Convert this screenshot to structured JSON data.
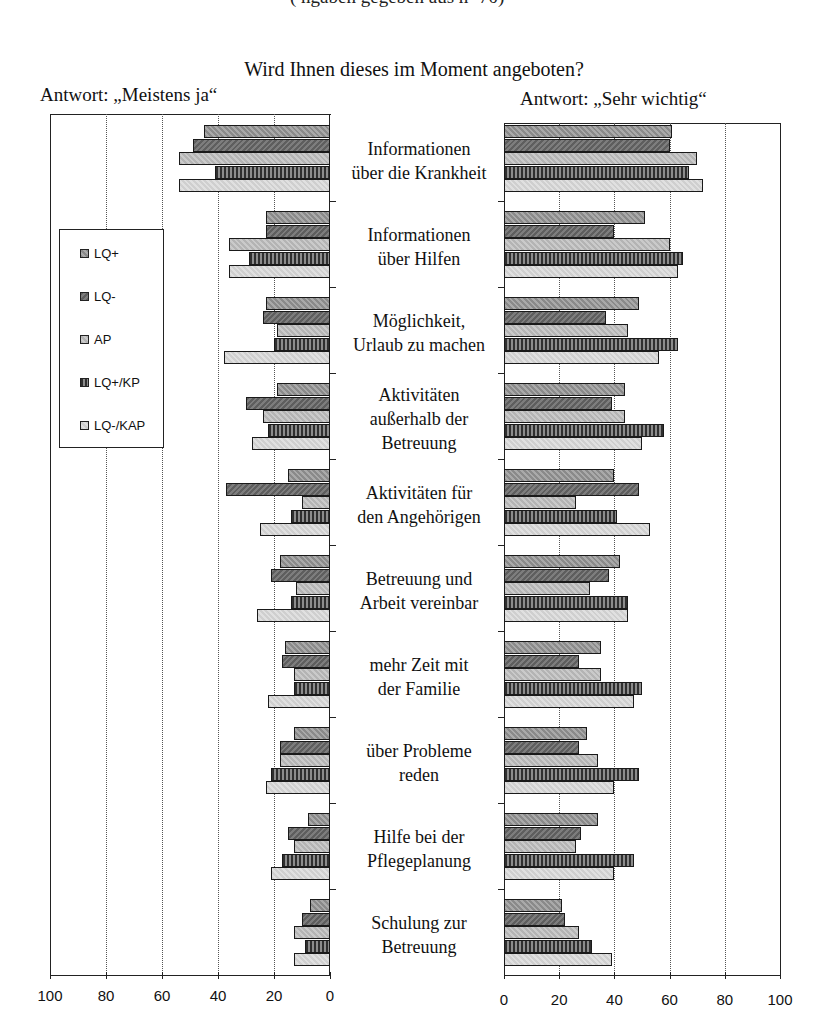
{
  "header": {
    "cutoff_line": "(                   ngaben gegeben aus n=70)",
    "title": "Wird Ihnen dieses im Moment angeboten?",
    "left_subtitle": "Antwort: „Meistens ja“",
    "right_subtitle": "Antwort: „Sehr wichtig“"
  },
  "legend": {
    "items": [
      {
        "label": "LQ+"
      },
      {
        "label": "LQ-"
      },
      {
        "label": "AP"
      },
      {
        "label": "LQ+/KP"
      },
      {
        "label": "LQ-/KAP"
      }
    ]
  },
  "axes": {
    "left_ticks": [
      "100",
      "80",
      "60",
      "40",
      "20",
      "0"
    ],
    "right_ticks": [
      "0",
      "20",
      "40",
      "60",
      "80",
      "100"
    ]
  },
  "categories": [
    {
      "line1": "Informationen",
      "line2": "über die Krankheit",
      "line3": ""
    },
    {
      "line1": "Informationen",
      "line2": "über Hilfen",
      "line3": ""
    },
    {
      "line1": "Möglichkeit,",
      "line2": "Urlaub zu machen",
      "line3": ""
    },
    {
      "line1": "Aktivitäten",
      "line2": "außerhalb der",
      "line3": "Betreuung"
    },
    {
      "line1": "Aktivitäten für",
      "line2": "den Angehörigen",
      "line3": ""
    },
    {
      "line1": "Betreuung und",
      "line2": "Arbeit vereinbar",
      "line3": ""
    },
    {
      "line1": "mehr Zeit mit",
      "line2": "der Familie",
      "line3": ""
    },
    {
      "line1": "über Probleme",
      "line2": "reden",
      "line3": ""
    },
    {
      "line1": "Hilfe bei der",
      "line2": "Pflegeplanung",
      "line3": ""
    },
    {
      "line1": "Schulung zur",
      "line2": "Betreuung",
      "line3": ""
    }
  ],
  "chart_data": [
    {
      "type": "bar",
      "orientation": "horizontal",
      "direction": "right-to-left",
      "title": "Antwort: „Meistens ja“",
      "supertitle": "Wird Ihnen dieses im Moment angeboten?",
      "xlabel": "",
      "xlim": [
        0,
        100
      ],
      "xticks": [
        0,
        20,
        40,
        60,
        80,
        100
      ],
      "grid": true,
      "legend_position": "inside-left",
      "categories": [
        "Informationen über die Krankheit",
        "Informationen über Hilfen",
        "Möglichkeit, Urlaub zu machen",
        "Aktivitäten außerhalb der Betreuung",
        "Aktivitäten für den Angehörigen",
        "Betreuung und Arbeit vereinbar",
        "mehr Zeit mit der Familie",
        "über Probleme reden",
        "Hilfe bei der Pflegeplanung",
        "Schulung zur Betreuung"
      ],
      "series": [
        {
          "name": "LQ+",
          "values": [
            45,
            23,
            23,
            19,
            15,
            18,
            16,
            13,
            8,
            7
          ]
        },
        {
          "name": "LQ-",
          "values": [
            49,
            23,
            24,
            30,
            37,
            21,
            17,
            18,
            15,
            10
          ]
        },
        {
          "name": "AP",
          "values": [
            54,
            36,
            19,
            24,
            10,
            12,
            13,
            18,
            13,
            13
          ]
        },
        {
          "name": "LQ+/KP",
          "values": [
            41,
            29,
            20,
            22,
            14,
            14,
            13,
            21,
            17,
            9
          ]
        },
        {
          "name": "LQ-/KAP",
          "values": [
            54,
            36,
            38,
            28,
            25,
            26,
            22,
            23,
            21,
            13
          ]
        }
      ]
    },
    {
      "type": "bar",
      "orientation": "horizontal",
      "direction": "left-to-right",
      "title": "Antwort: „Sehr wichtig“",
      "xlabel": "",
      "xlim": [
        0,
        100
      ],
      "xticks": [
        0,
        20,
        40,
        60,
        80,
        100
      ],
      "grid": true,
      "categories": [
        "Informationen über die Krankheit",
        "Informationen über Hilfen",
        "Möglichkeit, Urlaub zu machen",
        "Aktivitäten außerhalb der Betreuung",
        "Aktivitäten für den Angehörigen",
        "Betreuung und Arbeit vereinbar",
        "mehr Zeit mit der Familie",
        "über Probleme reden",
        "Hilfe bei der Pflegeplanung",
        "Schulung zur Betreuung"
      ],
      "series": [
        {
          "name": "LQ+",
          "values": [
            61,
            51,
            49,
            44,
            40,
            42,
            35,
            30,
            34,
            21
          ]
        },
        {
          "name": "LQ-",
          "values": [
            60,
            40,
            37,
            39,
            49,
            38,
            27,
            27,
            28,
            22
          ]
        },
        {
          "name": "AP",
          "values": [
            70,
            60,
            45,
            44,
            26,
            31,
            35,
            34,
            26,
            27
          ]
        },
        {
          "name": "LQ+/KP",
          "values": [
            67,
            65,
            63,
            58,
            41,
            45,
            50,
            49,
            47,
            32
          ]
        },
        {
          "name": "LQ-/KAP",
          "values": [
            72,
            63,
            56,
            50,
            53,
            45,
            47,
            40,
            40,
            39
          ]
        }
      ]
    }
  ]
}
